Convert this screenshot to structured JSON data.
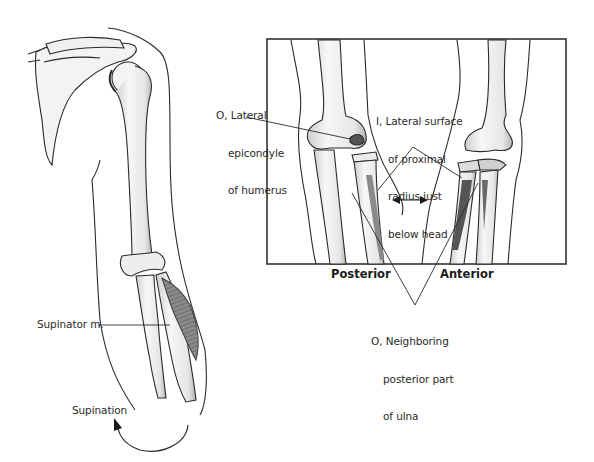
{
  "figure": {
    "inset": {
      "views": [
        {
          "id": "posterior",
          "label": "Posterior"
        },
        {
          "id": "anterior",
          "label": "Anterior"
        }
      ],
      "arrow": "double-headed-arrow"
    },
    "labels": {
      "origin_epicondyle": {
        "prefix": "O,",
        "lines": [
          "O, Lateral",
          "epicondyle",
          "of humerus"
        ]
      },
      "insertion_radius": {
        "prefix": "I,",
        "lines": [
          "I, Lateral surface",
          "of proximal",
          "radius just",
          "below head"
        ]
      },
      "origin_ulna": {
        "prefix": "O,",
        "lines": [
          "O, Neighboring",
          "posterior part",
          "of ulna"
        ]
      },
      "muscle": "Supinator m.",
      "motion": "Supination"
    },
    "colors": {
      "line": "#2a2a2a",
      "bone_fill": "#f2f2f2",
      "bone_shade": "#9a9a9a",
      "muscle": "#7a7a7a",
      "frame": "#333333"
    }
  }
}
